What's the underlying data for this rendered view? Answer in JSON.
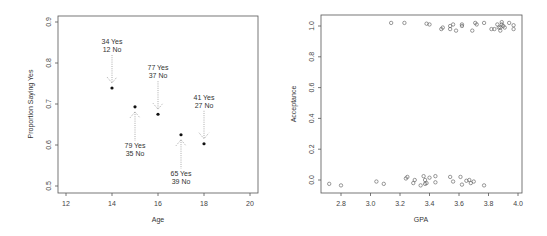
{
  "chart_data": [
    {
      "type": "scatter",
      "title": "",
      "xlabel": "Age",
      "ylabel": "Proportion Saying Yes",
      "xlim": [
        11.6,
        20.4
      ],
      "ylim": [
        0.485,
        0.915
      ],
      "xticks": [
        12,
        14,
        16,
        18,
        20
      ],
      "yticks": [
        0.5,
        0.6,
        0.7,
        0.8,
        0.9
      ],
      "grid": false,
      "legend": null,
      "points": [
        {
          "x": 14,
          "y": 0.739,
          "yes": 34,
          "no": 12,
          "label_yes": "34 Yes",
          "label_no": "12 No",
          "label_pos": "above"
        },
        {
          "x": 15,
          "y": 0.693,
          "yes": 79,
          "no": 35,
          "label_yes": "79 Yes",
          "label_no": "35 No",
          "label_pos": "below"
        },
        {
          "x": 16,
          "y": 0.675,
          "yes": 77,
          "no": 37,
          "label_yes": "77 Yes",
          "label_no": "37 No",
          "label_pos": "above"
        },
        {
          "x": 17,
          "y": 0.625,
          "yes": 65,
          "no": 39,
          "label_yes": "65 Yes",
          "label_no": "39 No",
          "label_pos": "below"
        },
        {
          "x": 18,
          "y": 0.603,
          "yes": 41,
          "no": 27,
          "label_yes": "41 Yes",
          "label_no": "27 No",
          "label_pos": "above"
        }
      ]
    },
    {
      "type": "scatter",
      "title": "",
      "xlabel": "GPA",
      "ylabel": "Acceptance",
      "xlim": [
        2.66,
        4.03
      ],
      "ylim": [
        -0.08,
        1.08
      ],
      "xticks": [
        2.8,
        3.0,
        3.2,
        3.4,
        3.6,
        3.8,
        4.0
      ],
      "yticks": [
        0.0,
        0.2,
        0.4,
        0.6,
        0.8,
        1.0
      ],
      "grid": false,
      "legend": null,
      "series": [
        {
          "name": "Accepted (1)",
          "points": [
            [
              3.14,
              1.02
            ],
            [
              3.23,
              1.02
            ],
            [
              3.38,
              1.015
            ],
            [
              3.4,
              1.01
            ],
            [
              3.48,
              0.98
            ],
            [
              3.49,
              0.99
            ],
            [
              3.54,
              1.0
            ],
            [
              3.54,
              0.98
            ],
            [
              3.56,
              1.01
            ],
            [
              3.58,
              0.97
            ],
            [
              3.62,
              1.01
            ],
            [
              3.62,
              1.0
            ],
            [
              3.69,
              0.97
            ],
            [
              3.71,
              1.02
            ],
            [
              3.72,
              1.01
            ],
            [
              3.77,
              1.02
            ],
            [
              3.82,
              0.98
            ],
            [
              3.84,
              0.98
            ],
            [
              3.86,
              1.01
            ],
            [
              3.87,
              0.99
            ],
            [
              3.88,
              0.97
            ],
            [
              3.88,
              0.99
            ],
            [
              3.89,
              1.025
            ],
            [
              3.89,
              1.01
            ],
            [
              3.9,
              1.0
            ],
            [
              3.91,
              0.99
            ],
            [
              3.94,
              1.02
            ],
            [
              3.97,
              1.005
            ],
            [
              3.97,
              0.98
            ]
          ]
        },
        {
          "name": "Rejected (0)",
          "points": [
            [
              2.72,
              -0.025
            ],
            [
              2.8,
              -0.035
            ],
            [
              3.04,
              -0.01
            ],
            [
              3.09,
              -0.025
            ],
            [
              3.24,
              0.01
            ],
            [
              3.25,
              0.02
            ],
            [
              3.29,
              -0.02
            ],
            [
              3.3,
              0.0
            ],
            [
              3.34,
              -0.035
            ],
            [
              3.36,
              0.025
            ],
            [
              3.37,
              0.0
            ],
            [
              3.37,
              -0.025
            ],
            [
              3.38,
              -0.02
            ],
            [
              3.4,
              0.015
            ],
            [
              3.44,
              0.025
            ],
            [
              3.44,
              -0.015
            ],
            [
              3.54,
              0.02
            ],
            [
              3.56,
              -0.01
            ],
            [
              3.61,
              0.02
            ],
            [
              3.62,
              -0.03
            ],
            [
              3.65,
              -0.005
            ],
            [
              3.67,
              0.0
            ],
            [
              3.68,
              -0.02
            ],
            [
              3.7,
              -0.01
            ],
            [
              3.77,
              -0.035
            ]
          ]
        }
      ]
    }
  ],
  "left_plot": {
    "xlabel": "Age",
    "ylabel": "Proportion Saying Yes",
    "xticks": [
      "12",
      "14",
      "16",
      "18",
      "20"
    ],
    "yticks": [
      "0.5",
      "0.6",
      "0.7",
      "0.8",
      "0.9"
    ]
  },
  "right_plot": {
    "xlabel": "GPA",
    "ylabel": "Acceptance",
    "xticks": [
      "2.8",
      "3.0",
      "3.2",
      "3.4",
      "3.6",
      "3.8",
      "4.0"
    ],
    "yticks": [
      "0.0",
      "0.2",
      "0.4",
      "0.6",
      "0.8",
      "1.0"
    ]
  },
  "colors": {
    "axis": "#555555",
    "point": "#111111",
    "open_point": "#555555",
    "arrow": "#888888"
  }
}
